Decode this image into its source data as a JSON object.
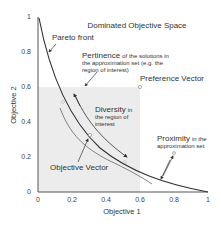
{
  "title": "Dominated Objective Space",
  "axes": {
    "x_label": "Objective 1",
    "y_label": "Objective 2",
    "x_ticks": [
      "0",
      "0.2",
      "0.4",
      "0.6",
      "0.8",
      "1"
    ],
    "y_ticks": [
      "0",
      "0.2",
      "0.4",
      "0.6",
      "0.8",
      "1"
    ]
  },
  "labels": {
    "pareto_front": "Pareto front",
    "pertinence_big": "Pertinence",
    "pertinence_small_1": "of the solutions in",
    "pertinence_small_2": "the approximation set (e.g. the",
    "pertinence_small_3": "region of interest)",
    "preference_vector": "Preference Vector",
    "diversity_big": "Diversity",
    "diversity_small_1": "in",
    "diversity_small_2": "the region of",
    "diversity_small_3": "interest",
    "objective_vector": "Objective Vector",
    "proximity_big": "Proximity",
    "proximity_small_1": "in the",
    "proximity_small_2": "approximation set"
  },
  "colors": {
    "region_of_interest": "#ebebeb",
    "curve": "#333333",
    "text": "#333333"
  },
  "region_of_interest": {
    "x": [
      0,
      0.6
    ],
    "y": [
      0,
      0.6
    ]
  },
  "preference_vector_point": {
    "x": 0.6,
    "y": 0.6
  },
  "proximity_point": {
    "x": 0.8,
    "y": 0.2
  }
}
